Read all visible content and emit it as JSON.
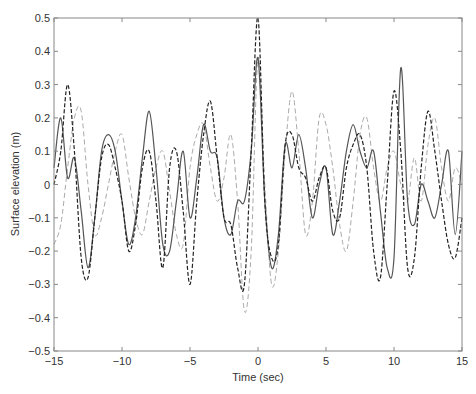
{
  "chart_data": {
    "type": "line",
    "title": "",
    "xlabel": "Time (sec)",
    "ylabel": "Surface elevation (m)",
    "xlim": [
      -15,
      15
    ],
    "ylim": [
      -0.5,
      0.5
    ],
    "xticks": [
      -15,
      -10,
      -5,
      0,
      5,
      10,
      15
    ],
    "yticks": [
      -0.5,
      -0.4,
      -0.3,
      -0.2,
      -0.1,
      0,
      0.1,
      0.2,
      0.3,
      0.4,
      0.5
    ],
    "xtick_labels": [
      "−15",
      "−10",
      "−5",
      "0",
      "5",
      "10",
      "15"
    ],
    "ytick_labels": [
      "−0.5",
      "−0.4",
      "−0.3",
      "−0.2",
      "−0.1",
      "0",
      "0.1",
      "0.2",
      "0.3",
      "0.4",
      "0.5"
    ],
    "grid": false,
    "legend": null,
    "x": [
      -15,
      -14.5,
      -14,
      -13.5,
      -13,
      -12.5,
      -12,
      -11.5,
      -11,
      -10.5,
      -10,
      -9.5,
      -9,
      -8.5,
      -8,
      -7.5,
      -7,
      -6.5,
      -6,
      -5.5,
      -5,
      -4.5,
      -4,
      -3.5,
      -3,
      -2.5,
      -2,
      -1.5,
      -1,
      -0.5,
      0,
      0.5,
      1,
      1.5,
      2,
      2.5,
      3,
      3.5,
      4,
      4.5,
      5,
      5.5,
      6,
      6.5,
      7,
      7.5,
      8,
      8.5,
      9,
      9.5,
      10,
      10.5,
      11,
      11.5,
      12,
      12.5,
      13,
      13.5,
      14,
      14.5,
      15
    ],
    "series": [
      {
        "name": "solid",
        "style": "solid",
        "color": "#555555",
        "values": [
          0.05,
          0.2,
          0.02,
          0.08,
          -0.08,
          -0.25,
          -0.1,
          0.1,
          0.15,
          0.1,
          -0.05,
          -0.18,
          -0.1,
          0.08,
          0.22,
          0.05,
          -0.18,
          -0.2,
          -0.05,
          0.1,
          -0.1,
          0.02,
          0.18,
          0.1,
          0.08,
          -0.1,
          -0.15,
          -0.05,
          -0.05,
          0.1,
          0.38,
          -0.05,
          -0.25,
          -0.15,
          0.12,
          0.05,
          0.15,
          0.05,
          -0.1,
          0.0,
          0.05,
          -0.15,
          -0.05,
          0.1,
          0.18,
          0.1,
          0.05,
          0.1,
          -0.08,
          -0.25,
          -0.22,
          0.35,
          -0.05,
          -0.12,
          0.0,
          -0.05,
          -0.1,
          0.0,
          0.1,
          -0.15,
          0.1
        ]
      },
      {
        "name": "dashed",
        "style": "dashed",
        "color": "#222222",
        "values": [
          0.0,
          0.1,
          0.3,
          0.1,
          -0.22,
          -0.28,
          -0.1,
          0.08,
          0.12,
          0.05,
          -0.05,
          -0.2,
          -0.12,
          0.05,
          0.1,
          -0.05,
          -0.25,
          0.05,
          0.1,
          -0.08,
          -0.3,
          -0.05,
          0.15,
          0.25,
          0.08,
          -0.1,
          -0.12,
          -0.25,
          -0.3,
          0.1,
          0.5,
          -0.05,
          -0.22,
          -0.18,
          0.12,
          0.15,
          0.05,
          0.02,
          -0.05,
          0.02,
          0.05,
          -0.08,
          -0.1,
          0.05,
          0.12,
          0.15,
          0.05,
          -0.2,
          -0.28,
          0.0,
          0.28,
          0.1,
          -0.25,
          -0.22,
          0.05,
          0.22,
          0.1,
          -0.05,
          -0.18,
          -0.22,
          -0.1
        ]
      },
      {
        "name": "light-dashed",
        "style": "dashed",
        "color": "#aaaaaa",
        "values": [
          -0.18,
          -0.12,
          0.05,
          0.2,
          0.22,
          0.0,
          -0.15,
          -0.1,
          0.0,
          0.1,
          0.15,
          0.02,
          -0.1,
          -0.15,
          -0.05,
          0.05,
          0.1,
          -0.02,
          -0.15,
          -0.18,
          0.05,
          0.15,
          0.18,
          0.05,
          -0.05,
          0.02,
          0.15,
          -0.05,
          -0.38,
          -0.2,
          0.38,
          0.0,
          -0.3,
          -0.2,
          0.1,
          0.28,
          0.1,
          -0.15,
          -0.05,
          0.2,
          0.18,
          0.05,
          -0.12,
          -0.2,
          -0.05,
          0.15,
          0.2,
          0.05,
          -0.05,
          0.05,
          0.1,
          0.0,
          -0.05,
          0.08,
          -0.05,
          0.12,
          0.2,
          0.05,
          -0.05,
          0.05,
          0.0
        ]
      }
    ]
  }
}
